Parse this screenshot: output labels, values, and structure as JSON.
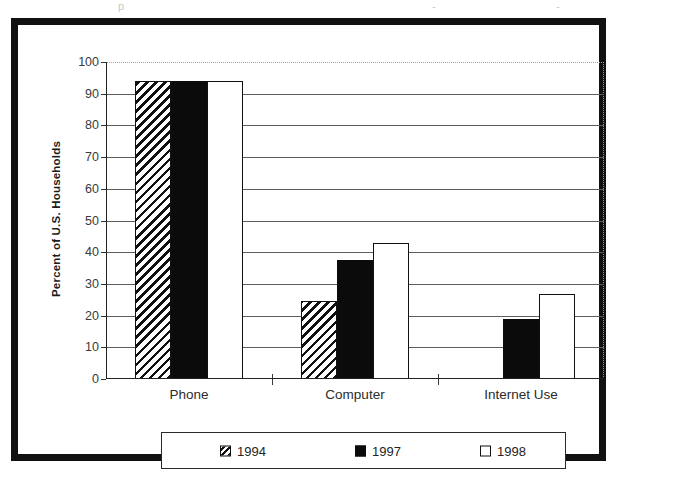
{
  "chart_data": {
    "type": "bar",
    "title": "",
    "xlabel": "",
    "ylabel": "Percent of U.S. Households",
    "categories": [
      "Phone",
      "Computer",
      "Internet Use"
    ],
    "series": [
      {
        "name": "1994",
        "values": [
          94,
          24.5,
          null
        ],
        "fill": "diagonal-hatch"
      },
      {
        "name": "1997",
        "values": [
          94,
          37.5,
          19
        ],
        "fill": "solid-black"
      },
      {
        "name": "1998",
        "values": [
          94,
          43,
          26.7
        ],
        "fill": "white-outline"
      }
    ],
    "ylim": [
      0,
      100
    ],
    "ytick_step": 10,
    "yticks": [
      0,
      10,
      20,
      30,
      40,
      50,
      60,
      70,
      80,
      90,
      100
    ],
    "ytick_labels": [
      "0",
      "10",
      "20",
      "30",
      "40",
      "50",
      "60",
      "70",
      "80",
      "90",
      "100"
    ],
    "grid": "horizontal",
    "legend_position": "bottom",
    "legend_entries": [
      "1994",
      "1997",
      "1998"
    ]
  },
  "colors": {
    "frame": "#111111",
    "bar_black": "#0b0b0b",
    "bar_white": "#ffffff",
    "gridline": "#5d5d5d",
    "axis": "#222222",
    "text": "#2b2b2b"
  },
  "scan_artifacts": {
    "left": "p",
    "middle": "-",
    "right": "-"
  }
}
